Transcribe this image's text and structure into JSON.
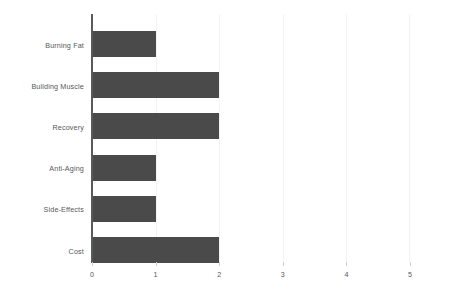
{
  "chart_data": {
    "type": "bar",
    "orientation": "horizontal",
    "title": "",
    "subtitle": "",
    "xlabel": "",
    "ylabel": "",
    "categories": [
      "Burning Fat",
      "Building Muscle",
      "Recovery",
      "Anti-Aging",
      "Side-Effects",
      "Cost"
    ],
    "values": [
      1,
      2,
      2,
      1,
      1,
      2
    ],
    "series": [
      {
        "name": "",
        "values": [
          1,
          2,
          2,
          1,
          1,
          2
        ]
      }
    ],
    "xlim": [
      0,
      5
    ],
    "xticks": [
      0,
      1,
      2,
      3,
      4,
      5
    ],
    "xtick_labels": [
      "0",
      "1",
      "2",
      "3",
      "4",
      "5"
    ],
    "grid": true,
    "grid_axis": "x",
    "legend": false,
    "legend_position": "none",
    "bar_color": "#4a4a4a",
    "axis_color": "#5a5a5a",
    "grid_color": "#f2f2f2",
    "label_color": "#575757",
    "background_color": "#ffffff"
  }
}
